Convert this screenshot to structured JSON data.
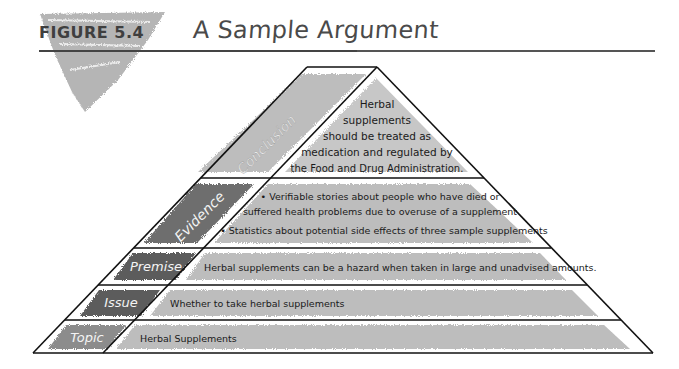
{
  "figure": {
    "label": "FIGURE 5.4",
    "title": "A Sample Argument"
  },
  "colors": {
    "dark_band": "#5e5e5e",
    "mid_band": "#8c8c8c",
    "light_band": "#c4c4c4",
    "outline": "#111111",
    "text": "#1a1a1a",
    "label_text": "#f2f2f2"
  },
  "pyramid": {
    "levels": [
      {
        "name": "Conclusion",
        "content": [
          "Herbal",
          "supplements",
          "should be treated as",
          "medication and regulated by",
          "the Food and Drug Administration."
        ]
      },
      {
        "name": "Evidence",
        "content": [
          "• Verifiable stories about people who have died or",
          "suffered health problems due to overuse of a supplement",
          "• Statistics about potential side effects of three sample supplements"
        ]
      },
      {
        "name": "Premise",
        "content": [
          "Herbal supplements can be a hazard when taken in large and unadvised amounts."
        ]
      },
      {
        "name": "Issue",
        "content": [
          "Whether to take herbal supplements"
        ]
      },
      {
        "name": "Topic",
        "content": [
          "Herbal Supplements"
        ]
      }
    ]
  }
}
